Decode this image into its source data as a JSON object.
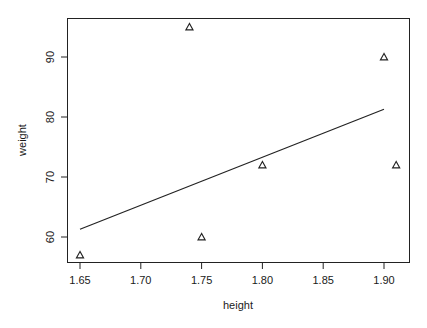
{
  "chart_data": {
    "type": "scatter",
    "title": "",
    "xlabel": "height",
    "ylabel": "weight",
    "xlim": [
      1.636,
      1.919
    ],
    "ylim": [
      55.5,
      96.6
    ],
    "xticks": [
      1.65,
      1.7,
      1.75,
      1.8,
      1.85,
      1.9
    ],
    "xtick_labels": [
      "1.65",
      "1.70",
      "1.75",
      "1.80",
      "1.85",
      "1.90"
    ],
    "yticks": [
      60,
      70,
      80,
      90
    ],
    "ytick_labels": [
      "60",
      "70",
      "80",
      "90"
    ],
    "grid": false,
    "marker": "triangle-open",
    "points": [
      {
        "x": 1.65,
        "y": 57
      },
      {
        "x": 1.74,
        "y": 95
      },
      {
        "x": 1.75,
        "y": 60
      },
      {
        "x": 1.8,
        "y": 72
      },
      {
        "x": 1.9,
        "y": 90
      },
      {
        "x": 1.91,
        "y": 72
      }
    ],
    "fit_line": {
      "x": [
        1.65,
        1.9
      ],
      "y": [
        61.3,
        81.3
      ],
      "label": "linear regression"
    }
  }
}
